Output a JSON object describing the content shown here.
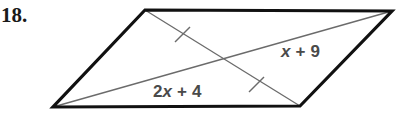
{
  "problem": {
    "number": "18."
  },
  "figure": {
    "name": "parallelogram-with-diagonals",
    "outline_color": "#111111",
    "diagonal_color": "#6b6b6b",
    "label_color": "#4a4a4a",
    "background_color": "#ffffff",
    "vertices": {
      "top_left": [
        145,
        10
      ],
      "top_right": [
        392,
        11
      ],
      "bottom_right": [
        300,
        106
      ],
      "bottom_left": [
        53,
        107
      ]
    },
    "diagonals": [
      {
        "name": "top-left-to-bottom-right",
        "from": [
          145,
          10
        ],
        "to": [
          300,
          106
        ]
      },
      {
        "name": "bottom-left-to-top-right",
        "from": [
          53,
          107
        ],
        "to": [
          392,
          11
        ]
      }
    ],
    "intersection_point": [
      222,
      60
    ],
    "tick_marks": [
      {
        "name": "congruence-tick-upper",
        "at": [
          182,
          35
        ]
      },
      {
        "name": "congruence-tick-lower",
        "at": [
          256,
          85
        ]
      }
    ]
  },
  "labels": {
    "upper": {
      "name": "segment-label-x-plus-9",
      "full_text": "x + 9",
      "variable": "x",
      "operator": "+",
      "constant": "9",
      "x": 281,
      "y": 52
    },
    "lower": {
      "name": "segment-label-2x-plus-4",
      "full_text": "2x + 4",
      "coefficient": "2",
      "variable": "x",
      "operator": "+",
      "constant": "4",
      "x": 153,
      "y": 92
    }
  }
}
